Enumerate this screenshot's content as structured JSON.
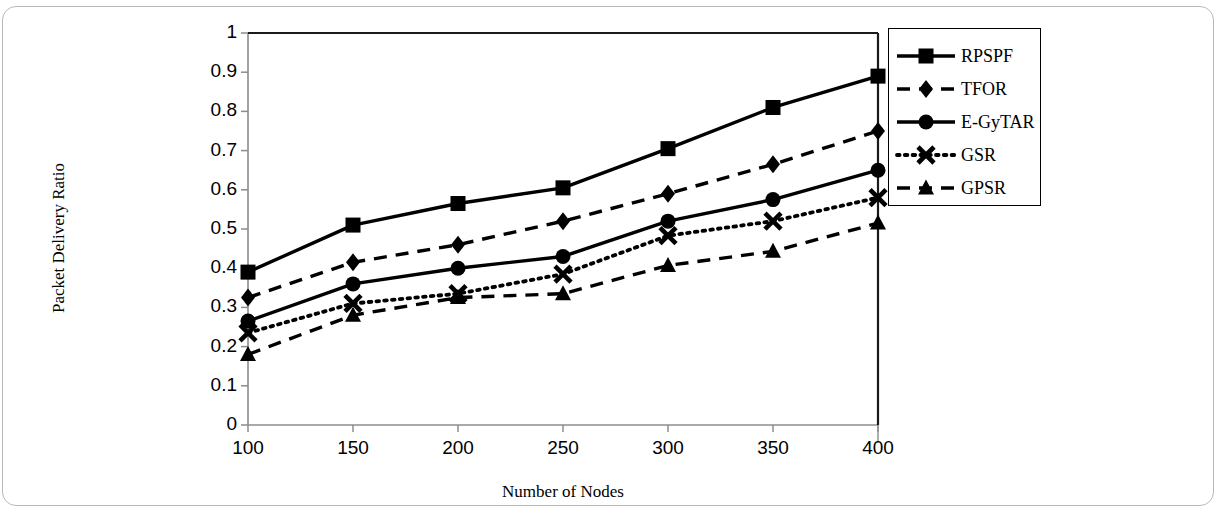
{
  "figure": {
    "kind": "line-chart",
    "background_color": "#ffffff",
    "frame_color": "#b9b9b9",
    "series_color": "#000000"
  },
  "chart_data": {
    "type": "line",
    "title": "",
    "xlabel": "Number of Nodes",
    "ylabel": "Packet Delivery Ratio",
    "x": [
      100,
      150,
      200,
      250,
      300,
      350,
      400
    ],
    "categories": [
      "100",
      "150",
      "200",
      "250",
      "300",
      "350",
      "400"
    ],
    "xlim": [
      100,
      400
    ],
    "ylim": [
      0,
      1
    ],
    "ytick_labels": [
      "0",
      "0.1",
      "0.2",
      "0.3",
      "0.4",
      "0.5",
      "0.6",
      "0.7",
      "0.8",
      "0.9",
      "1"
    ],
    "ytick_values": [
      0,
      0.1,
      0.2,
      0.3,
      0.4,
      0.5,
      0.6,
      0.7,
      0.8,
      0.9,
      1
    ],
    "xtick_labels": [
      "100",
      "150",
      "200",
      "250",
      "300",
      "350",
      "400"
    ],
    "grid": false,
    "legend_position": "right-outside",
    "series": [
      {
        "name": "RPSPF",
        "marker": "square",
        "line_style": "solid",
        "color": "#000000",
        "values": [
          0.39,
          0.51,
          0.565,
          0.605,
          0.705,
          0.81,
          0.89
        ]
      },
      {
        "name": "TFOR",
        "marker": "diamond",
        "line_style": "dashed",
        "color": "#000000",
        "values": [
          0.325,
          0.415,
          0.46,
          0.52,
          0.59,
          0.665,
          0.75
        ]
      },
      {
        "name": "E-GyTAR",
        "marker": "circle",
        "line_style": "solid",
        "color": "#000000",
        "values": [
          0.265,
          0.36,
          0.4,
          0.43,
          0.52,
          0.575,
          0.65
        ]
      },
      {
        "name": "GSR",
        "marker": "cross",
        "line_style": "dotted",
        "color": "#000000",
        "values": [
          0.235,
          0.31,
          0.335,
          0.385,
          0.483,
          0.52,
          0.58
        ]
      },
      {
        "name": "GPSR",
        "marker": "triangle",
        "line_style": "dashed",
        "color": "#000000",
        "values": [
          0.18,
          0.28,
          0.325,
          0.335,
          0.407,
          0.443,
          0.515
        ]
      }
    ]
  },
  "legend": {
    "entries": [
      {
        "label": "RPSPF"
      },
      {
        "label": "TFOR"
      },
      {
        "label": "E-GyTAR"
      },
      {
        "label": "GSR"
      },
      {
        "label": "GPSR"
      }
    ]
  }
}
